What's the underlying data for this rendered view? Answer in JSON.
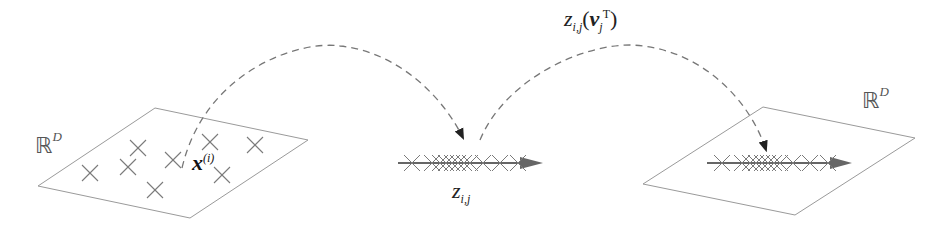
{
  "figure": {
    "left_space_label": "ℝ",
    "left_space_sup": "D",
    "point_label_base": "x",
    "point_label_sup": "(i)",
    "projection_label_base": "z",
    "projection_label_sub": "i,j",
    "reconstruction_label_base": "z",
    "reconstruction_label_sub": "i,j",
    "reconstruction_label_arg": "(v",
    "reconstruction_label_arg_sub": "j",
    "reconstruction_label_arg_sup": "T",
    "reconstruction_label_close": ")",
    "right_space_label": "ℝ",
    "right_space_sup": "D"
  },
  "colors": {
    "plane_stroke": "#9a9a9a",
    "cross_stroke": "#7a7a7a",
    "dashed_arc": "#777777",
    "axis_arrow": "#666666",
    "arrowhead": "#222222"
  },
  "left_plane": {
    "corners": [
      [
        38,
        186
      ],
      [
        155,
        108
      ],
      [
        308,
        140
      ],
      [
        190,
        218
      ]
    ],
    "points": [
      [
        90,
        173
      ],
      [
        128,
        167
      ],
      [
        138,
        148
      ],
      [
        173,
        160
      ],
      [
        155,
        190
      ],
      [
        210,
        142
      ],
      [
        255,
        145
      ],
      [
        222,
        175
      ]
    ]
  },
  "middle_axis": {
    "y": 163,
    "x_start": 398,
    "x_end": 543,
    "projected_points_x": [
      412,
      432,
      440,
      446,
      452,
      458,
      464,
      470,
      483,
      500,
      518
    ]
  },
  "right_plane": {
    "corners": [
      [
        643,
        184
      ],
      [
        763,
        107
      ],
      [
        915,
        138
      ],
      [
        795,
        215
      ]
    ],
    "axis_y": 163,
    "axis_x_start": 707,
    "axis_x_end": 852,
    "projected_points_x": [
      722,
      742,
      750,
      756,
      762,
      768,
      774,
      780,
      793,
      810,
      828
    ]
  }
}
